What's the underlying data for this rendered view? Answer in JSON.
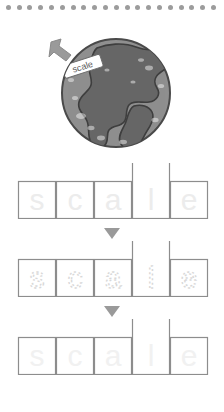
{
  "worksheet": {
    "word": "scale",
    "letters": [
      "s",
      "c",
      "a",
      "l",
      "e"
    ],
    "tall_letter_index": 3,
    "border_dot_count": 20,
    "border_dot_color": "#9c9c9c"
  },
  "illustration": {
    "name": "earth-globe-with-scale-label",
    "label_text": "scale",
    "pointer": "arrow-icon",
    "ocean_color": "#8f8f8f",
    "land_color": "#666666",
    "outline_color": "#4a4a4a",
    "arrow_color": "#9a9a9a"
  },
  "rows": [
    {
      "id": "row-trace-1",
      "style": "solid-faint",
      "letters": [
        "s",
        "c",
        "a",
        "l",
        "e"
      ],
      "letter_color": "#ececec",
      "box_border_color": "#8d8d8d"
    },
    {
      "id": "row-trace-2",
      "style": "dotted",
      "letters": [
        "s",
        "c",
        "a",
        "l",
        "e"
      ],
      "letter_color": "#d8d8d8",
      "box_border_color": "#8d8d8d"
    },
    {
      "id": "row-trace-3",
      "style": "solid-faintest",
      "letters": [
        "s",
        "c",
        "a",
        "l",
        "e"
      ],
      "letter_color": "#f1f1f1",
      "box_border_color": "#8d8d8d"
    }
  ],
  "separators": [
    {
      "id": "separator-1",
      "glyph": "▼",
      "color": "#9a9a9a"
    },
    {
      "id": "separator-2",
      "glyph": "▼",
      "color": "#9a9a9a"
    }
  ]
}
